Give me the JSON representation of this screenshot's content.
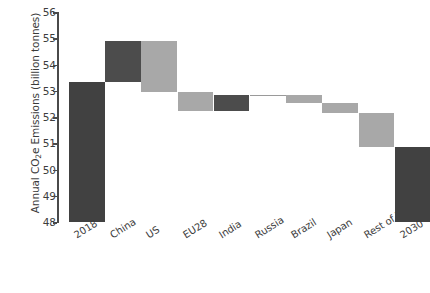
{
  "chart_data": {
    "type": "bar",
    "subtype": "waterfall",
    "title": "",
    "xlabel": "",
    "ylabel": "Annual CO2e Emissions (billion tonnes)",
    "ylabel_rich": {
      "pre": "Annual CO",
      "sub": "2",
      "post": "e Emissions (billion tonnes)"
    },
    "ylim": [
      48,
      56
    ],
    "yticks": [
      56,
      55,
      54,
      53,
      52,
      51,
      50,
      49,
      48
    ],
    "ytick_labels": [
      "56",
      "55",
      "54",
      "53",
      "52",
      "51",
      "50",
      "49",
      "48"
    ],
    "grid": false,
    "legend": false,
    "legend_position": "none",
    "categories": [
      "2018",
      "China",
      "US",
      "EU28",
      "India",
      "Russia",
      "Brazil",
      "Japan",
      "Rest of World",
      "2030"
    ],
    "bar_kinds": [
      "total",
      "increase",
      "decrease",
      "decrease",
      "increase",
      "increase",
      "decrease",
      "decrease",
      "decrease",
      "total"
    ],
    "deltas": [
      53.35,
      1.55,
      -1.95,
      -0.72,
      0.6,
      0.02,
      -0.3,
      -0.38,
      -1.32,
      50.0
    ],
    "cumulative_top": [
      53.35,
      54.9,
      54.9,
      52.95,
      52.83,
      52.85,
      52.85,
      52.55,
      52.17,
      50.0
    ],
    "cumulative_bottom": [
      48.0,
      53.35,
      52.95,
      52.23,
      52.23,
      52.83,
      52.55,
      52.17,
      50.85,
      48.0
    ],
    "bars": [
      {
        "label": "2018",
        "kind": "total",
        "value": 53.35,
        "top": 53.35,
        "bottom": 48.0,
        "color": "#414141"
      },
      {
        "label": "China",
        "kind": "increase",
        "value": 1.55,
        "top": 54.9,
        "bottom": 53.35,
        "color": "#4c4c4c"
      },
      {
        "label": "US",
        "kind": "decrease",
        "value": -1.95,
        "top": 54.9,
        "bottom": 52.95,
        "color": "#a8a8a8"
      },
      {
        "label": "EU28",
        "kind": "decrease",
        "value": -0.72,
        "top": 52.95,
        "bottom": 52.23,
        "color": "#a8a8a8"
      },
      {
        "label": "India",
        "kind": "increase",
        "value": 0.6,
        "top": 52.83,
        "bottom": 52.23,
        "color": "#4c4c4c"
      },
      {
        "label": "Russia",
        "kind": "increase",
        "value": 0.02,
        "top": 52.85,
        "bottom": 52.83,
        "color": "#9a9a9a"
      },
      {
        "label": "Brazil",
        "kind": "decrease",
        "value": -0.3,
        "top": 52.85,
        "bottom": 52.55,
        "color": "#a8a8a8"
      },
      {
        "label": "Japan",
        "kind": "decrease",
        "value": -0.38,
        "top": 52.55,
        "bottom": 52.17,
        "color": "#a8a8a8"
      },
      {
        "label": "Rest of World",
        "kind": "decrease",
        "value": -1.32,
        "top": 52.17,
        "bottom": 50.85,
        "color": "#a8a8a8"
      },
      {
        "label": "2030",
        "kind": "total",
        "value": 50.0,
        "top": 50.85,
        "bottom": 48.0,
        "color": "#414141"
      }
    ],
    "colors": {
      "increase": "#414141",
      "decrease": "#a8a8a8",
      "total": "#414141",
      "axis": "#4a4a4a",
      "text": "#3d3d3d",
      "background": "#ffffff"
    }
  }
}
